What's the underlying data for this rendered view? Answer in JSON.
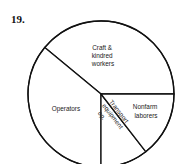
{
  "question_number": "19.",
  "chart_data": {
    "type": "pie",
    "title": "",
    "categories": [
      "Craft & kindred workers",
      "Operators",
      "Transport equipment op.",
      "Nonfarm laborers"
    ],
    "values": [
      39,
      36,
      10.5,
      14.5
    ],
    "start_angle_deg": 0,
    "direction": "counterclockwise",
    "labels_inside": true,
    "colors": [
      "#ffffff",
      "#ffffff",
      "#ffffff",
      "#ffffff"
    ],
    "outline_color": "#111111"
  },
  "labels": {
    "craft": [
      "Craft &",
      "kindred",
      "workers"
    ],
    "operators": [
      "Operators"
    ],
    "nonfarm": [
      "Nonfarm",
      "laborers"
    ],
    "transport": [
      "Transport",
      "equipment",
      "op."
    ]
  }
}
